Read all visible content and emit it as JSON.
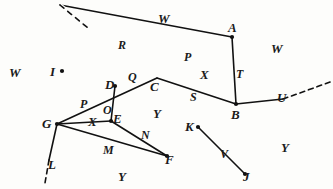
{
  "figure": {
    "width": 333,
    "height": 189,
    "background_color": "#fdfdfb",
    "ink_color": "#111111",
    "stroke_width": 1.6,
    "vertices": [
      {
        "id": "A",
        "label": "A",
        "x": 232,
        "y": 37,
        "dot": true,
        "label_x": 228,
        "label_y": 21
      },
      {
        "id": "B",
        "label": "B",
        "x": 236,
        "y": 104,
        "dot": true,
        "label_x": 231,
        "label_y": 108
      },
      {
        "id": "C",
        "label": "C",
        "x": 157,
        "y": 78,
        "dot": false,
        "label_x": 150,
        "label_y": 80
      },
      {
        "id": "D",
        "label": "D",
        "x": 115,
        "y": 86,
        "dot": true,
        "label_x": 105,
        "label_y": 78
      },
      {
        "id": "E",
        "label": "E",
        "x": 111,
        "y": 121,
        "dot": true,
        "label_x": 113,
        "label_y": 112
      },
      {
        "id": "F",
        "label": "F",
        "x": 167,
        "y": 156,
        "dot": true,
        "label_x": 165,
        "label_y": 153
      },
      {
        "id": "G",
        "label": "G",
        "x": 57,
        "y": 124,
        "dot": true,
        "label_x": 42,
        "label_y": 117
      },
      {
        "id": "I",
        "label": "I",
        "x": 62,
        "y": 71,
        "dot": true,
        "label_x": 50,
        "label_y": 65
      },
      {
        "id": "J",
        "label": "J",
        "x": 245,
        "y": 174,
        "dot": true,
        "label_x": 243,
        "label_y": 170
      },
      {
        "id": "K",
        "label": "K",
        "x": 198,
        "y": 127,
        "dot": true,
        "label_x": 185,
        "label_y": 120
      },
      {
        "id": "L",
        "label": "L",
        "x": 45,
        "y": 180,
        "dot": false,
        "label_x": 48,
        "label_y": 158
      },
      {
        "id": "U",
        "label": "U",
        "x": 283,
        "y": 99,
        "dot": false,
        "label_x": 277,
        "label_y": 91
      }
    ],
    "segments": [
      {
        "id": "R-line",
        "name": "dashed-ray-R",
        "from": [
          60,
          5
        ],
        "to": [
          232,
          37
        ],
        "style": "solid",
        "dash_from": [
          60,
          5
        ],
        "dash_to": [
          88,
          28
        ]
      },
      {
        "id": "A-B",
        "name": "segment-T",
        "from": [
          232,
          37
        ],
        "to": [
          236,
          104
        ],
        "style": "solid"
      },
      {
        "id": "C-B",
        "name": "segment-S",
        "from": [
          157,
          78
        ],
        "to": [
          236,
          104
        ],
        "style": "solid"
      },
      {
        "id": "B-U",
        "name": "segment-U",
        "from": [
          236,
          104
        ],
        "to": [
          283,
          99
        ],
        "style": "solid"
      },
      {
        "id": "U-dash",
        "name": "dashed-ray-U",
        "from": [
          283,
          99
        ],
        "to": [
          333,
          81
        ],
        "style": "dashed"
      },
      {
        "id": "G-D-C",
        "name": "segment-P-left",
        "from": [
          57,
          124
        ],
        "to": [
          157,
          78
        ],
        "style": "solid"
      },
      {
        "id": "D-E",
        "name": "segment-O",
        "from": [
          115,
          86
        ],
        "to": [
          111,
          121
        ],
        "style": "solid"
      },
      {
        "id": "G-E",
        "name": "segment-X-left",
        "from": [
          57,
          124
        ],
        "to": [
          111,
          121
        ],
        "style": "solid"
      },
      {
        "id": "G-F",
        "name": "segment-M",
        "from": [
          57,
          124
        ],
        "to": [
          167,
          156
        ],
        "style": "solid"
      },
      {
        "id": "E-F",
        "name": "segment-N",
        "from": [
          111,
          121
        ],
        "to": [
          167,
          156
        ],
        "style": "solid"
      },
      {
        "id": "G-L",
        "name": "segment-L",
        "from": [
          57,
          124
        ],
        "to": [
          49,
          160
        ],
        "style": "solid"
      },
      {
        "id": "L-dash",
        "name": "dashed-ray-L",
        "from": [
          49,
          160
        ],
        "to": [
          45,
          183
        ],
        "style": "dashed"
      },
      {
        "id": "K-J",
        "name": "segment-V",
        "from": [
          198,
          127
        ],
        "to": [
          245,
          174
        ],
        "style": "solid"
      }
    ],
    "edge_labels": [
      {
        "id": "R",
        "label": "R",
        "x": 118,
        "y": 39
      },
      {
        "id": "P-top",
        "label": "P",
        "x": 184,
        "y": 51
      },
      {
        "id": "T",
        "label": "T",
        "x": 236,
        "y": 68
      },
      {
        "id": "S",
        "label": "S",
        "x": 190,
        "y": 91
      },
      {
        "id": "Q",
        "label": "Q",
        "x": 128,
        "y": 71
      },
      {
        "id": "P-left",
        "label": "P",
        "x": 80,
        "y": 98
      },
      {
        "id": "O",
        "label": "O",
        "x": 103,
        "y": 104
      },
      {
        "id": "N",
        "label": "N",
        "x": 141,
        "y": 129
      },
      {
        "id": "M",
        "label": "M",
        "x": 103,
        "y": 144
      },
      {
        "id": "V",
        "label": "V",
        "x": 220,
        "y": 148
      }
    ],
    "region_labels": [
      {
        "id": "W-topleft",
        "label": "W",
        "x": 9,
        "y": 66
      },
      {
        "id": "W-topmid",
        "label": "W",
        "x": 158,
        "y": 12
      },
      {
        "id": "W-topright",
        "label": "W",
        "x": 271,
        "y": 42
      },
      {
        "id": "X-right",
        "label": "X",
        "x": 200,
        "y": 68
      },
      {
        "id": "X-left",
        "label": "X",
        "x": 88,
        "y": 115
      },
      {
        "id": "Y-mid",
        "label": "Y",
        "x": 153,
        "y": 107
      },
      {
        "id": "Y-bottom",
        "label": "Y",
        "x": 118,
        "y": 170
      },
      {
        "id": "Y-right",
        "label": "Y",
        "x": 281,
        "y": 141
      }
    ]
  }
}
